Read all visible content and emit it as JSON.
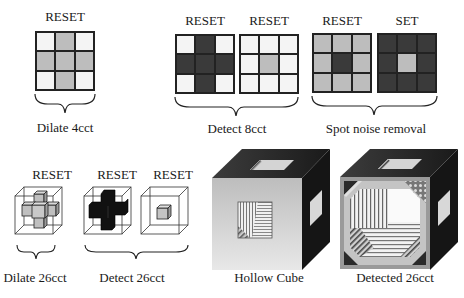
{
  "colors": {
    "white": "#f4f4f4",
    "light": "#bdbdbd",
    "mid": "#b8b8b8",
    "dark": "#3a3a3a",
    "black": "#111111",
    "cube_front": "#c9c9c9",
    "cube_side": "#1c1c1c"
  },
  "panels": {
    "dilate4": {
      "label": "RESET",
      "caption": "Dilate 4cct",
      "cells": [
        "white",
        "light",
        "white",
        "light",
        "light",
        "light",
        "white",
        "light",
        "white"
      ]
    },
    "detect8": {
      "caption": "Detect 8cct",
      "grids": [
        {
          "label": "RESET",
          "cells": [
            "white",
            "dark",
            "white",
            "dark",
            "dark",
            "dark",
            "white",
            "dark",
            "white"
          ]
        },
        {
          "label": "RESET",
          "cells": [
            "white",
            "white",
            "white",
            "white",
            "light",
            "white",
            "white",
            "white",
            "white"
          ]
        }
      ]
    },
    "spot": {
      "caption": "Spot noise removal",
      "grids": [
        {
          "label": "RESET",
          "cells": [
            "light",
            "light",
            "light",
            "light",
            "dark",
            "light",
            "light",
            "light",
            "light"
          ]
        },
        {
          "label": "SET",
          "cells": [
            "dark",
            "dark",
            "dark",
            "dark",
            "light",
            "dark",
            "dark",
            "dark",
            "dark"
          ]
        }
      ]
    },
    "dilate26": {
      "label": "RESET",
      "caption": "Dilate 26cct"
    },
    "detect26": {
      "labels": [
        "RESET",
        "RESET"
      ],
      "caption": "Detect 26cct"
    },
    "hollow": {
      "caption": "Hollow Cube"
    },
    "detected": {
      "caption": "Detected 26cct"
    }
  }
}
